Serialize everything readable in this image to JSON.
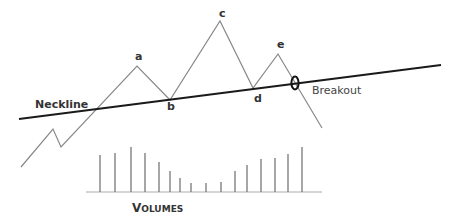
{
  "diagram": {
    "neckline_label": "Neckline",
    "breakout_label": "Breakout",
    "breakout_marker": "0",
    "volumes_label_first": "V",
    "volumes_label_rest": "OLUMES",
    "points": [
      {
        "label": "a",
        "x": 137,
        "y": 66,
        "lx": 135,
        "ly": 60
      },
      {
        "label": "b",
        "x": 170,
        "y": 100,
        "lx": 167,
        "ly": 110
      },
      {
        "label": "c",
        "x": 220,
        "y": 21,
        "lx": 219,
        "ly": 17
      },
      {
        "label": "d",
        "x": 253,
        "y": 88,
        "lx": 254,
        "ly": 102
      },
      {
        "label": "e",
        "x": 278,
        "y": 54,
        "lx": 277,
        "ly": 48
      }
    ],
    "price_path": [
      [
        21,
        167
      ],
      [
        53,
        129
      ],
      [
        61,
        147
      ],
      [
        137,
        66
      ],
      [
        170,
        100
      ],
      [
        220,
        21
      ],
      [
        253,
        88
      ],
      [
        278,
        54
      ],
      [
        322,
        128
      ]
    ],
    "neckline": [
      [
        19,
        119
      ],
      [
        441,
        65
      ]
    ],
    "volume_baseline": {
      "x1": 86,
      "x2": 322,
      "y": 192
    },
    "volume_bars": [
      {
        "x": 100,
        "top": 155
      },
      {
        "x": 115,
        "top": 153
      },
      {
        "x": 131,
        "top": 147
      },
      {
        "x": 145,
        "top": 153
      },
      {
        "x": 159,
        "top": 162
      },
      {
        "x": 170,
        "top": 171
      },
      {
        "x": 180,
        "top": 178
      },
      {
        "x": 191,
        "top": 183
      },
      {
        "x": 206,
        "top": 183
      },
      {
        "x": 221,
        "top": 182
      },
      {
        "x": 235,
        "top": 171
      },
      {
        "x": 247,
        "top": 165
      },
      {
        "x": 261,
        "top": 159
      },
      {
        "x": 275,
        "top": 158
      },
      {
        "x": 288,
        "top": 154
      },
      {
        "x": 302,
        "top": 147
      }
    ],
    "colors": {
      "line": "#888888",
      "neckline": "#1a1a1a",
      "bars": "#777777",
      "text": "#333333"
    }
  }
}
